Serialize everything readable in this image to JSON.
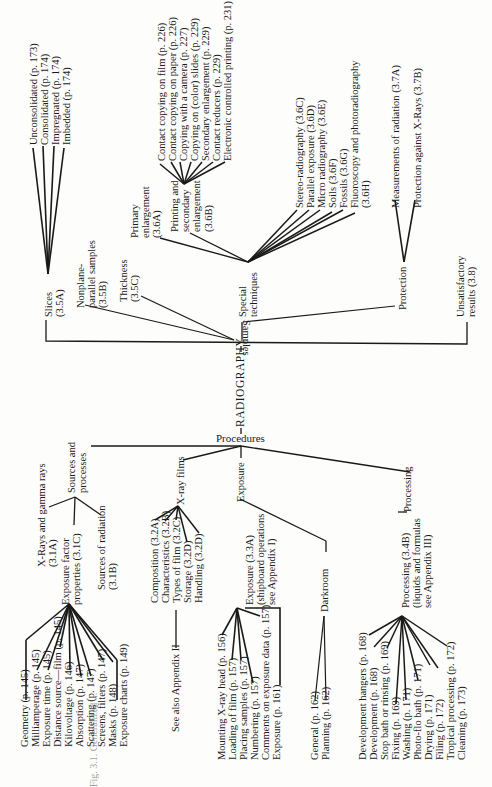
{
  "diagram": {
    "root": "RADIOGRAPHY",
    "samples": {
      "label": "Samples",
      "slices": {
        "label": "Slices\n(3.5A)",
        "children": [
          "Unconsolidated (p. 173)",
          "Consolidated (p. 174)",
          "Impregnated (p. 174)",
          "Imbedded (p. 174)"
        ]
      },
      "nonplane": "Nonplane-\nparallel samples\n(3.5B)",
      "thickness": "Thickness\n(3.5C)",
      "special": {
        "label": "Special\ntechniques",
        "primary": "Primary\nenlargement\n(3.6A)",
        "printing": {
          "label": "Printing and\nsecondary\nenlargement\n(3.6B)",
          "children": [
            "Contact copying on film (p. 226)",
            "Contact copying on paper (p. 226)",
            "Copying with a camera (p. 227)",
            "Copying on (color) slides (p. 229)",
            "Secondary enlargement (p. 229)",
            "Contact reducers (p. 229)",
            "Electronic controlled printing (p. 231)"
          ]
        },
        "children": [
          "Stereo-radiography (3.6C)",
          "Parallel exposure (3.6D)",
          "Micro radiography (3.6E)",
          "Soils (3.6F)",
          "Fossils (3.6G)",
          "Fluoroscopy and photoradiography\n(3.6H)"
        ]
      },
      "protection": {
        "label": "Protection",
        "children": [
          "Measurements of radiation (3.7A)",
          "Protection against X-Rays (3.7B)"
        ]
      },
      "unsatisfactory": "Unsatisfactory\nresults (3.8)"
    },
    "procedures": {
      "label": "Procedures",
      "sources": {
        "label": "Sources and\nprocesses",
        "xrays": "X-Rays and gamma rays\n(3.1A)",
        "exposure_factor": {
          "label": "Exposure factor\nproperties (3.1C)",
          "children": [
            "Geometry (p. 145)",
            "Milliamperage (p. 145)",
            "Exposure time (p. 145)",
            "Distance source—film (p. 145)",
            "Kilovoltage (p. 146)",
            "Absorption (p. 147)",
            "Scattering (p. 147)",
            "Screens, filters (p. 147)",
            "Masks (p. 148)",
            "Exposure charts (p. 149)"
          ]
        },
        "sources_radiation": "Sources of radiation\n(3.1B)"
      },
      "xray_films": {
        "label": "X-ray films",
        "children": [
          "Composition (3.2A)",
          "Characteristics (3.2B)",
          "Types of film (3.2C)",
          "Storage (3.2D)",
          "Handling (3.2D)"
        ],
        "see_also": "See also Appendix II"
      },
      "exposure": {
        "label": "Exposure",
        "sub": {
          "label": "Exposure (3.3A)\n(shipboard operations\nsee Appendix I)",
          "children": [
            "Mounting X-ray head (p. 156)",
            "Loading of film (p. 157)",
            "Placing samples (p. 157)",
            "Numbering (p. 157)",
            "Comments on exposure data (p. 157)",
            "Exposure (p. 161)"
          ]
        },
        "darkroom": {
          "label": "Darkroom",
          "children": [
            "General (p. 162)",
            "Planning (p. 162)"
          ]
        }
      },
      "processing": {
        "label": "Processing",
        "sub": {
          "label": "Processing (3.4B)\n(liquids and formulas\nsee Appendix III)",
          "children": [
            "Development hangers (p. 168)",
            "Development (p. 168)",
            "Stop bath or rinsing (p. 169)",
            "Fixing (p. 169)",
            "Washing (p. 171)",
            "Photo-flo bath (p. 171)",
            "Drying (p. 171)",
            "Filing (p. 172)",
            "Tropical processing (p. 172)",
            "Cleaning (p. 173)"
          ]
        }
      }
    },
    "caption": "Fig. 3.1. Generalized ..."
  }
}
